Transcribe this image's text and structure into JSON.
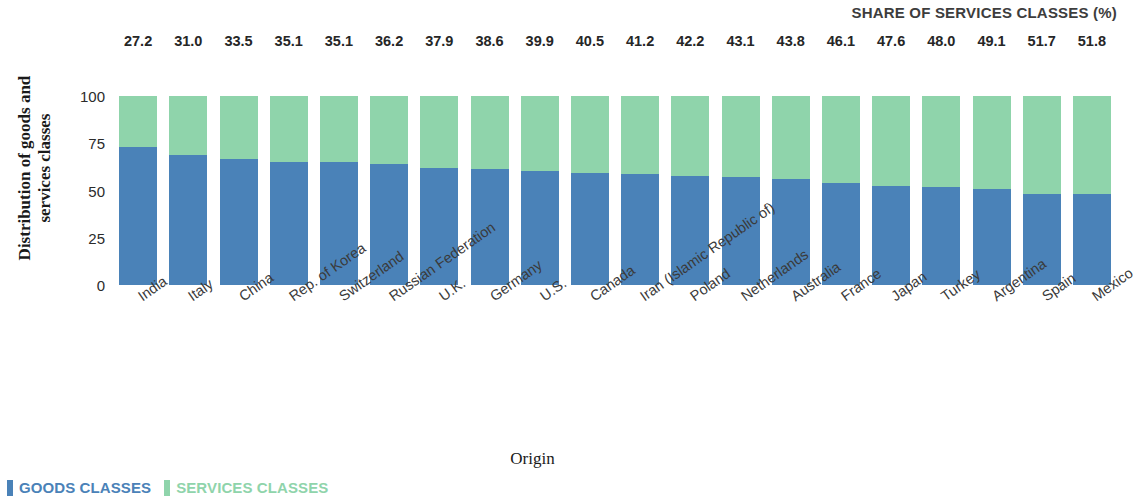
{
  "chart_data": {
    "type": "bar",
    "subtype": "stacked-100-percent",
    "title": "SHARE OF SERVICES CLASSES (%)",
    "xlabel": "Origin",
    "ylabel": "Distribution of goods and services classes",
    "ylabel_line1": "Distribution of goods and",
    "ylabel_line2": "services classes",
    "ylim": [
      0,
      100
    ],
    "yticks": [
      100,
      75,
      50,
      25,
      0
    ],
    "grid": false,
    "legend_position": "bottom-left",
    "categories": [
      "India",
      "Italy",
      "China",
      "Rep. of Korea",
      "Switzerland",
      "Russian Federation",
      "U.K.",
      "Germany",
      "U.S.",
      "Canada",
      "Iran (Islamic Republic of)",
      "Poland",
      "Netherlands",
      "Australia",
      "France",
      "Japan",
      "Turkey",
      "Argentina",
      "Spain",
      "Mexico"
    ],
    "series": [
      {
        "name": "GOODS CLASSES",
        "color": "#4a82b8",
        "values": [
          72.8,
          69.0,
          66.5,
          64.9,
          64.9,
          63.8,
          62.1,
          61.4,
          60.1,
          59.5,
          58.8,
          57.8,
          56.9,
          56.2,
          53.9,
          52.4,
          52.0,
          50.9,
          48.3,
          48.2
        ]
      },
      {
        "name": "SERVICES CLASSES",
        "color": "#8fd4ab",
        "values": [
          27.2,
          31.0,
          33.5,
          35.1,
          35.1,
          36.2,
          37.9,
          38.6,
          39.9,
          40.5,
          41.2,
          42.2,
          43.1,
          43.8,
          46.1,
          47.6,
          48.0,
          49.1,
          51.7,
          51.8
        ]
      }
    ],
    "data_labels": [
      "27.2",
      "31.0",
      "33.5",
      "35.1",
      "35.1",
      "36.2",
      "37.9",
      "38.6",
      "39.9",
      "40.5",
      "41.2",
      "42.2",
      "43.1",
      "43.8",
      "46.1",
      "47.6",
      "48.0",
      "49.1",
      "51.7",
      "51.8"
    ]
  },
  "legend": {
    "items": [
      {
        "label": "GOODS CLASSES",
        "color": "#4a82b8"
      },
      {
        "label": "SERVICES CLASSES",
        "color": "#8fd4ab"
      }
    ]
  }
}
